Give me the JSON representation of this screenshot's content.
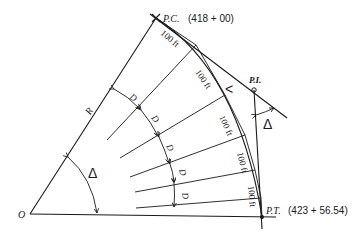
{
  "diagram": {
    "type": "circular-curve-layout",
    "points": {
      "pc": {
        "label": "P.C.",
        "station": "(418 + 00)"
      },
      "pi": {
        "label": "P.I."
      },
      "pt": {
        "label": "P.T.",
        "station": "(423 + 56.54)"
      },
      "o": {
        "label": "O"
      }
    },
    "radius_label": "R",
    "central_angle_label": "Δ",
    "deflection_angle_label": "Δ",
    "chord_labels": [
      "100 ft",
      "100 ft",
      "100 ft",
      "100 ft",
      "100 ft"
    ],
    "degree_of_curve_labels": [
      "D",
      "D",
      "D",
      "D",
      "D"
    ],
    "tangent_mark": "<"
  }
}
